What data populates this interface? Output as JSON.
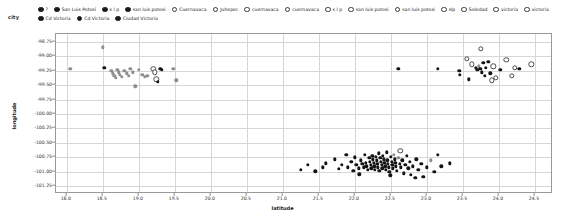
{
  "legend": {
    "title": "city",
    "items": [
      {
        "label": "?",
        "marker": "filled"
      },
      {
        "label": "San Luis Potosí",
        "marker": "filled"
      },
      {
        "label": "s l p",
        "marker": "filled"
      },
      {
        "label": "san luis potosi",
        "marker": "filled"
      },
      {
        "label": "Cuernavaca",
        "marker": "hollow"
      },
      {
        "label": "Juhepec",
        "marker": "hollow"
      },
      {
        "label": "cuernavaca",
        "marker": "hollow"
      },
      {
        "label": "cuernavaca",
        "marker": "hollow"
      },
      {
        "label": "s l p",
        "marker": "hollow"
      },
      {
        "label": "san luis potosi",
        "marker": "hollow"
      },
      {
        "label": "san luis potosi",
        "marker": "hollow"
      },
      {
        "label": "slp",
        "marker": "hollow"
      },
      {
        "label": "Soledad",
        "marker": "hollow"
      },
      {
        "label": "victoria",
        "marker": "hollow"
      },
      {
        "label": "victoria",
        "marker": "hollow"
      },
      {
        "label": "Cd Victoria",
        "marker": "filled"
      },
      {
        "label": "Cd Victoria",
        "marker": "filled"
      },
      {
        "label": "Ciudad Victoria",
        "marker": "filled"
      }
    ]
  },
  "chart_data": {
    "type": "scatter",
    "title": "",
    "xlabel": "latitude",
    "ylabel": "longitude",
    "xlim": [
      17.85,
      24.75
    ],
    "ylim": [
      -101.38,
      -98.62
    ],
    "grid": true,
    "legend_position": "top",
    "xticks": [
      "18.0",
      "18.5",
      "19.0",
      "19.5",
      "20.0",
      "20.5",
      "21.0",
      "21.5",
      "22.0",
      "22.5",
      "23.0",
      "23.5",
      "24.0",
      "24.5"
    ],
    "xtick_values": [
      18.0,
      18.5,
      19.0,
      19.5,
      20.0,
      20.5,
      21.0,
      21.5,
      22.0,
      22.5,
      23.0,
      23.5,
      24.0,
      24.5
    ],
    "yticks": [
      "-98.75",
      "-99.00",
      "-99.25",
      "-99.50",
      "-99.75",
      "-100.00",
      "-100.25",
      "-100.50",
      "-100.75",
      "-101.00",
      "-101.25"
    ],
    "ytick_values": [
      -98.75,
      -99.0,
      -99.25,
      -99.5,
      -99.75,
      -100.0,
      -100.25,
      -100.5,
      -100.75,
      -101.0,
      -101.25
    ],
    "series": [
      {
        "name": "cuernavaca-cluster",
        "marker": "mixed",
        "points": [
          [
            18.05,
            -99.22,
            "grey"
          ],
          [
            18.5,
            -98.85,
            "grey"
          ],
          [
            18.52,
            -99.2,
            "filled"
          ],
          [
            18.62,
            -99.26,
            "grey"
          ],
          [
            18.64,
            -99.3,
            "grey"
          ],
          [
            18.66,
            -99.34,
            "grey"
          ],
          [
            18.68,
            -99.38,
            "grey"
          ],
          [
            18.7,
            -99.24,
            "grey"
          ],
          [
            18.72,
            -99.28,
            "grey"
          ],
          [
            18.74,
            -99.32,
            "grey"
          ],
          [
            18.76,
            -99.36,
            "grey"
          ],
          [
            18.8,
            -99.26,
            "grey"
          ],
          [
            18.83,
            -99.3,
            "grey"
          ],
          [
            18.86,
            -99.34,
            "grey"
          ],
          [
            18.88,
            -99.22,
            "grey"
          ],
          [
            18.92,
            -99.28,
            "grey"
          ],
          [
            18.95,
            -99.52,
            "grey"
          ],
          [
            19.0,
            -99.24,
            "grey"
          ],
          [
            19.05,
            -99.32,
            "grey"
          ],
          [
            19.08,
            -99.36,
            "grey"
          ],
          [
            19.12,
            -99.34,
            "grey"
          ],
          [
            19.2,
            -99.22,
            "hollow"
          ],
          [
            19.22,
            -99.28,
            "hollow"
          ],
          [
            19.24,
            -99.4,
            "hollow"
          ],
          [
            19.26,
            -99.44,
            "filled"
          ],
          [
            19.3,
            -99.22,
            "filled"
          ],
          [
            19.32,
            -99.24,
            "filled"
          ],
          [
            19.48,
            -99.22,
            "grey"
          ],
          [
            19.52,
            -99.42,
            "grey"
          ]
        ]
      },
      {
        "name": "san-luis-potosi-cluster",
        "marker": "mixed",
        "points": [
          [
            21.35,
            -100.88,
            "filled"
          ],
          [
            21.55,
            -100.92,
            "filled"
          ],
          [
            21.6,
            -100.85,
            "filled"
          ],
          [
            21.72,
            -100.78,
            "filled"
          ],
          [
            21.78,
            -100.95,
            "filled"
          ],
          [
            21.82,
            -100.88,
            "filled"
          ],
          [
            21.88,
            -100.7,
            "filled"
          ],
          [
            21.9,
            -100.92,
            "filled"
          ],
          [
            21.95,
            -100.82,
            "filled"
          ],
          [
            21.98,
            -100.98,
            "filled"
          ],
          [
            22.0,
            -100.75,
            "filled"
          ],
          [
            22.02,
            -100.88,
            "filled"
          ],
          [
            22.05,
            -100.94,
            "filled"
          ],
          [
            22.08,
            -100.8,
            "filled"
          ],
          [
            22.1,
            -100.86,
            "filled"
          ],
          [
            22.12,
            -100.92,
            "filled"
          ],
          [
            22.14,
            -100.7,
            "filled"
          ],
          [
            22.15,
            -100.84,
            "filled"
          ],
          [
            22.16,
            -100.9,
            "filled"
          ],
          [
            22.18,
            -100.96,
            "filled"
          ],
          [
            22.2,
            -100.76,
            "filled"
          ],
          [
            22.21,
            -100.82,
            "filled"
          ],
          [
            22.22,
            -100.88,
            "filled"
          ],
          [
            22.23,
            -100.94,
            "filled"
          ],
          [
            22.24,
            -100.72,
            "filled"
          ],
          [
            22.25,
            -100.78,
            "filled"
          ],
          [
            22.26,
            -100.84,
            "filled"
          ],
          [
            22.27,
            -100.9,
            "filled"
          ],
          [
            22.28,
            -100.96,
            "filled"
          ],
          [
            22.29,
            -100.74,
            "filled"
          ],
          [
            22.3,
            -100.8,
            "filled"
          ],
          [
            22.31,
            -100.86,
            "filled"
          ],
          [
            22.32,
            -100.92,
            "filled"
          ],
          [
            22.33,
            -100.68,
            "filled"
          ],
          [
            22.34,
            -100.98,
            "filled"
          ],
          [
            22.35,
            -100.76,
            "filled"
          ],
          [
            22.36,
            -100.82,
            "filled"
          ],
          [
            22.37,
            -100.88,
            "filled"
          ],
          [
            22.38,
            -100.94,
            "filled"
          ],
          [
            22.39,
            -100.72,
            "filled"
          ],
          [
            22.4,
            -100.78,
            "filled"
          ],
          [
            22.41,
            -100.84,
            "filled"
          ],
          [
            22.42,
            -100.9,
            "filled"
          ],
          [
            22.43,
            -100.96,
            "filled"
          ],
          [
            22.44,
            -100.66,
            "filled"
          ],
          [
            22.45,
            -100.8,
            "filled"
          ],
          [
            22.46,
            -100.86,
            "filled"
          ],
          [
            22.47,
            -100.92,
            "filled"
          ],
          [
            22.48,
            -101.0,
            "filled"
          ],
          [
            22.5,
            -100.74,
            "filled"
          ],
          [
            22.51,
            -100.82,
            "filled"
          ],
          [
            22.52,
            -100.88,
            "filled"
          ],
          [
            22.53,
            -100.94,
            "filled"
          ],
          [
            22.54,
            -100.7,
            "grey"
          ],
          [
            22.55,
            -100.78,
            "filled"
          ],
          [
            22.56,
            -100.84,
            "filled"
          ],
          [
            22.57,
            -100.9,
            "filled"
          ],
          [
            22.58,
            -100.98,
            "filled"
          ],
          [
            22.6,
            -100.76,
            "grey"
          ],
          [
            22.62,
            -100.86,
            "filled"
          ],
          [
            22.64,
            -100.92,
            "filled"
          ],
          [
            22.66,
            -100.8,
            "filled"
          ],
          [
            22.68,
            -101.02,
            "filled"
          ],
          [
            22.7,
            -100.88,
            "filled"
          ],
          [
            22.72,
            -100.72,
            "filled"
          ],
          [
            22.74,
            -100.94,
            "filled"
          ],
          [
            22.76,
            -100.82,
            "filled"
          ],
          [
            22.78,
            -101.05,
            "filled"
          ],
          [
            22.8,
            -100.9,
            "filled"
          ],
          [
            22.85,
            -100.78,
            "filled"
          ],
          [
            22.88,
            -100.96,
            "filled"
          ],
          [
            22.92,
            -100.86,
            "filled"
          ],
          [
            22.95,
            -101.08,
            "filled"
          ],
          [
            23.0,
            -100.92,
            "filled"
          ],
          [
            23.05,
            -100.8,
            "grey"
          ],
          [
            23.1,
            -101.0,
            "filled"
          ],
          [
            23.2,
            -100.9,
            "filled"
          ],
          [
            23.32,
            -100.85,
            "filled"
          ],
          [
            21.25,
            -100.96,
            "filled"
          ],
          [
            21.45,
            -100.99,
            "filled"
          ],
          [
            22.06,
            -101.04,
            "filled"
          ],
          [
            22.49,
            -101.06,
            "filled"
          ],
          [
            22.63,
            -100.64,
            "hollow"
          ],
          [
            22.84,
            -101.1,
            "filled"
          ],
          [
            23.15,
            -100.7,
            "filled"
          ]
        ]
      },
      {
        "name": "victoria-cluster",
        "marker": "mixed",
        "points": [
          [
            22.6,
            -99.22,
            "filled"
          ],
          [
            23.15,
            -99.22,
            "filled"
          ],
          [
            23.45,
            -99.25,
            "filled"
          ],
          [
            23.46,
            -99.32,
            "filled"
          ],
          [
            23.55,
            -99.05,
            "hollow"
          ],
          [
            23.62,
            -99.14,
            "hollow"
          ],
          [
            23.68,
            -99.2,
            "filled"
          ],
          [
            23.7,
            -99.24,
            "filled"
          ],
          [
            23.72,
            -99.18,
            "grey"
          ],
          [
            23.74,
            -99.22,
            "filled"
          ],
          [
            23.75,
            -98.88,
            "hollow"
          ],
          [
            23.76,
            -99.28,
            "filled"
          ],
          [
            23.78,
            -99.12,
            "filled"
          ],
          [
            23.8,
            -99.34,
            "filled"
          ],
          [
            23.82,
            -99.2,
            "filled"
          ],
          [
            23.85,
            -99.1,
            "filled"
          ],
          [
            23.88,
            -99.3,
            "filled"
          ],
          [
            23.92,
            -99.18,
            "hollow"
          ],
          [
            23.96,
            -99.38,
            "hollow"
          ],
          [
            24.02,
            -99.24,
            "filled"
          ],
          [
            24.1,
            -99.06,
            "hollow"
          ],
          [
            24.18,
            -99.34,
            "hollow"
          ],
          [
            24.22,
            -99.2,
            "hollow"
          ],
          [
            24.28,
            -99.22,
            "filled"
          ],
          [
            24.45,
            -99.14,
            "hollow"
          ],
          [
            23.58,
            -99.4,
            "filled"
          ],
          [
            23.9,
            -99.42,
            "hollow"
          ]
        ]
      }
    ]
  }
}
